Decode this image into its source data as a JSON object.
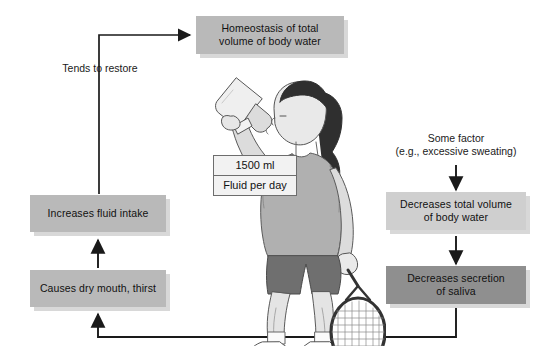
{
  "diagram": {
    "boxes": {
      "homeostasis": "Homeostasis of total\nvolume of body water",
      "increases_intake": "Increases fluid intake",
      "causes_thirst": "Causes dry mouth, thirst",
      "decreases_volume": "Decreases total volume\nof body water",
      "decreases_saliva": "Decreases secretion\nof saliva"
    },
    "labels": {
      "tends_to_restore": "Tends to restore",
      "some_factor": "Some factor\n(e.g., excessive sweating)"
    },
    "callout": {
      "amount": "1500 ml",
      "caption": "Fluid per day"
    },
    "illustration": {
      "subject": "woman drinking from water bottle holding tennis racket"
    },
    "colors": {
      "box_fill": "#b9b9b9",
      "box_fill_light": "#cfcfcf",
      "box_fill_dark": "#8f8f8f",
      "box_shadow": "#d8d8d8",
      "arrow": "#1a1a1a",
      "text": "#111111",
      "background": "#ffffff"
    }
  }
}
